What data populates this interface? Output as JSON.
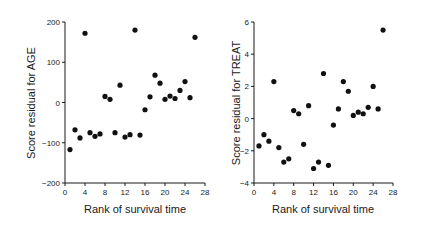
{
  "chart_data": [
    {
      "type": "scatter",
      "title": "",
      "xlabel": "Rank of survival time",
      "ylabel": "Score residual for AGE",
      "xlim": [
        0,
        28
      ],
      "ylim": [
        -200,
        200
      ],
      "xticks": [
        0,
        4,
        8,
        12,
        16,
        20,
        24,
        28
      ],
      "yticks": [
        -200,
        -100,
        0,
        100,
        200
      ],
      "grid": false,
      "x": [
        1,
        2,
        3,
        4,
        5,
        6,
        7,
        8,
        9,
        10,
        11,
        12,
        13,
        14,
        15,
        16,
        17,
        18,
        19,
        20,
        21,
        22,
        23,
        24,
        25,
        26
      ],
      "y": [
        -117,
        -68,
        -88,
        172,
        -75,
        -84,
        -78,
        15,
        8,
        -75,
        43,
        -86,
        -80,
        180,
        -81,
        -18,
        14,
        68,
        48,
        8,
        16,
        10,
        30,
        52,
        12,
        162
      ]
    },
    {
      "type": "scatter",
      "title": "",
      "xlabel": "Rank of survival time",
      "ylabel": "Score residual for TREAT",
      "xlim": [
        0,
        28
      ],
      "ylim": [
        -4,
        6
      ],
      "xticks": [
        0,
        4,
        8,
        12,
        16,
        20,
        24,
        28
      ],
      "yticks": [
        -4,
        -2,
        0,
        2,
        4,
        6
      ],
      "grid": false,
      "x": [
        1,
        2,
        3,
        4,
        5,
        6,
        7,
        8,
        9,
        10,
        11,
        12,
        13,
        14,
        15,
        16,
        17,
        18,
        19,
        20,
        21,
        22,
        23,
        24,
        25,
        26
      ],
      "y": [
        -1.7,
        -1.0,
        -1.4,
        2.3,
        -1.8,
        -2.7,
        -2.5,
        0.5,
        0.3,
        -1.6,
        0.8,
        -3.1,
        -2.7,
        2.8,
        -2.9,
        -0.4,
        0.6,
        2.3,
        1.7,
        0.2,
        0.4,
        0.3,
        0.7,
        2.0,
        0.6,
        5.5
      ]
    }
  ],
  "labels": {
    "left_y": "Score residual for AGE",
    "left_x": "Rank of survival time",
    "right_y": "Score residual for TREAT",
    "right_x": "Rank of survival time"
  }
}
